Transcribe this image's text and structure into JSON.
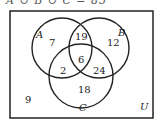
{
  "caption": "A ∪ B ∪ C = 85",
  "universe_label": "U",
  "sets": [
    {
      "name": "A",
      "cx": 62,
      "cy": 48,
      "r": 30
    },
    {
      "name": "B",
      "cx": 99,
      "cy": 48,
      "r": 30
    },
    {
      "name": "C",
      "cx": 81,
      "cy": 76,
      "r": 32
    }
  ],
  "regions": {
    "A_only": "7",
    "B_only": "12",
    "C_only": "18",
    "A_and_B_only": "19",
    "A_and_C_only": "2",
    "B_and_C_only": "24",
    "A_B_C": "6",
    "outside": "9"
  },
  "set_labels": {
    "A": "A",
    "B": "B",
    "C": "C"
  }
}
